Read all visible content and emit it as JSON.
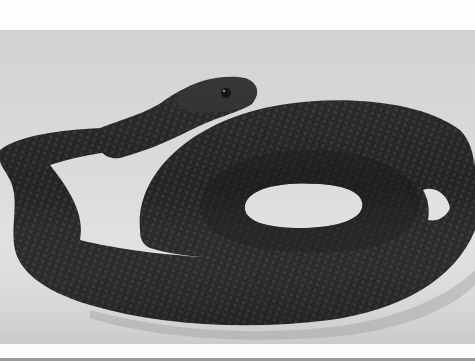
{
  "image": {
    "subject": "coiled black snake on light gray background",
    "description": "Black-and-white photograph of a dark, scaled snake coiled in a loop with its head raised at upper center, set against a pale gray studio backdrop",
    "colors": {
      "background": "#d2d2d2",
      "background_light": "#ececec",
      "snake_body": "#2a2a2a",
      "snake_dark": "#151515",
      "snake_highlight": "#5a5a5a",
      "frame_white": "#fdfdfd",
      "bottom_strip": "#9a9a9a"
    }
  }
}
